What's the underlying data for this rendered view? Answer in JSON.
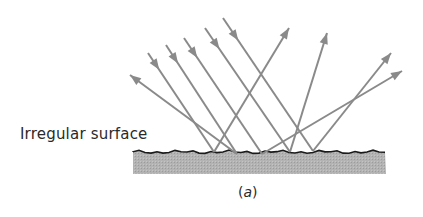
{
  "diagram": {
    "surface_label": "Irregular surface",
    "caption_open": "(",
    "caption_letter": "a",
    "caption_close": ")",
    "colors": {
      "ray": "#8a8a8a",
      "surface_fill": "#b3b3b3",
      "surface_edge": "#1a1a1a",
      "text": "#2a2a2a"
    },
    "surface": {
      "x1": 133,
      "x2": 386,
      "top": 152,
      "bottom": 174
    },
    "incident_rays": [
      {
        "from": [
          148,
          53
        ],
        "to": [
          214,
          152
        ]
      },
      {
        "from": [
          166,
          45
        ],
        "to": [
          237,
          154
        ]
      },
      {
        "from": [
          184,
          38
        ],
        "to": [
          262,
          154
        ]
      },
      {
        "from": [
          205,
          28
        ],
        "to": [
          290,
          152
        ]
      },
      {
        "from": [
          223,
          18
        ],
        "to": [
          313,
          151
        ]
      }
    ],
    "reflected_rays": [
      {
        "from": [
          214,
          152
        ],
        "to": [
          289,
          28
        ]
      },
      {
        "from": [
          237,
          154
        ],
        "to": [
          130,
          75
        ]
      },
      {
        "from": [
          262,
          154
        ],
        "to": [
          402,
          71
        ]
      },
      {
        "from": [
          290,
          152
        ],
        "to": [
          327,
          33
        ]
      },
      {
        "from": [
          313,
          151
        ],
        "to": [
          391,
          53
        ]
      }
    ]
  }
}
